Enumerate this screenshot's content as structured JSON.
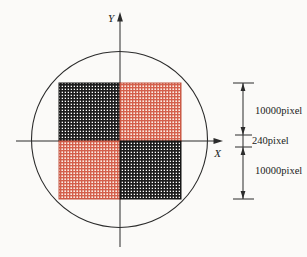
{
  "figure": {
    "axis": {
      "x_label": "X",
      "y_label": "Y"
    },
    "dimensions": [
      {
        "label": "10000pixel"
      },
      {
        "label": "240pixel"
      },
      {
        "label": "10000pixel"
      }
    ],
    "quadrants": [
      {
        "position": "top-left",
        "scheme": "black"
      },
      {
        "position": "top-right",
        "scheme": "red"
      },
      {
        "position": "bottom-left",
        "scheme": "red"
      },
      {
        "position": "bottom-right",
        "scheme": "black"
      }
    ],
    "colors": {
      "line": "#2b2b2b",
      "black_grid_line": "#1c1c1c",
      "black_grid_bg": "#ffffff",
      "black_grid_border": "#111111",
      "red_grid_line": "#d4604c",
      "red_grid_bg": "#fcefe8",
      "red_grid_border": "#c4523e",
      "text": "#1a1a1a"
    }
  }
}
